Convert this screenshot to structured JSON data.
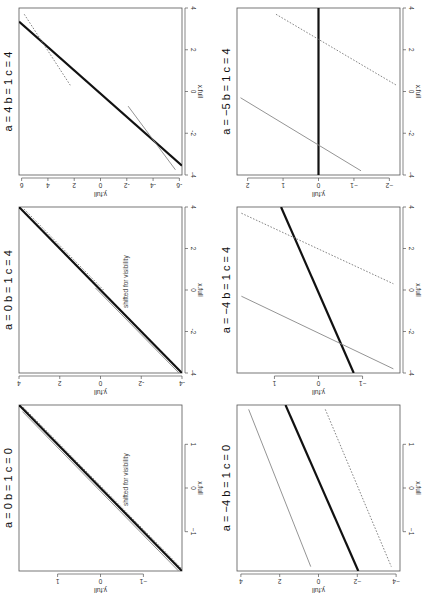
{
  "figure": {
    "orientation": "rotated 90 degrees clockwise",
    "panel_count": 6
  },
  "chart_data": [
    {
      "type": "line",
      "title": "a = 4  b = 1  c = 4",
      "title_parts": {
        "a": "4",
        "b": "1",
        "c": "4"
      },
      "xlabel": "x.full",
      "ylabel": "y.full",
      "xlim": [
        -4,
        4
      ],
      "ylim": [
        -6.2,
        6.2
      ],
      "xticks": [
        -4,
        -2,
        0,
        2,
        4
      ],
      "yticks": [
        -6,
        -4,
        -2,
        0,
        2,
        4,
        6
      ],
      "xtick_labels": [
        "-4",
        "-2",
        "0",
        "2",
        "4"
      ],
      "ytick_labels": [
        "-6",
        "-4",
        "-2",
        "0",
        "2",
        "4",
        "6"
      ],
      "note": "",
      "series": [
        {
          "name": "thick",
          "style": "solid-thick",
          "color": "#111111",
          "x": [
            -3.55,
            3.35
          ],
          "y": [
            -6.2,
            6.2
          ]
        },
        {
          "name": "thin",
          "style": "solid-thin",
          "color": "#888888",
          "x": [
            -0.7,
            -3.75
          ],
          "y": [
            -2.1,
            -5.7
          ]
        },
        {
          "name": "dotted",
          "style": "dotted",
          "color": "#777777",
          "x": [
            3.7,
            0.3
          ],
          "y": [
            5.8,
            2.3
          ]
        }
      ],
      "box": {
        "left": 19,
        "top": 8,
        "width": 163,
        "height": 167
      }
    },
    {
      "type": "line",
      "title": "a = 0  b = 1  c = 4",
      "title_parts": {
        "a": "0",
        "b": "1",
        "c": "4"
      },
      "xlabel": "x.full",
      "ylabel": "y.full",
      "xlim": [
        -4,
        4
      ],
      "ylim": [
        -4,
        4
      ],
      "xticks": [
        -4,
        -2,
        0,
        2,
        4
      ],
      "yticks": [
        -4,
        -2,
        0,
        2,
        4
      ],
      "xtick_labels": [
        "-4",
        "-2",
        "0",
        "2",
        "4"
      ],
      "ytick_labels": [
        "-4",
        "-2",
        "0",
        "2",
        "4"
      ],
      "note": "shifted for visibility",
      "series": [
        {
          "name": "thick",
          "style": "solid-thick",
          "color": "#111111",
          "x": [
            -4,
            4
          ],
          "y": [
            -4,
            4
          ]
        },
        {
          "name": "thin",
          "style": "solid-thin",
          "color": "#888888",
          "x": [
            -4,
            0.1
          ],
          "y": [
            -3.85,
            0.25
          ]
        },
        {
          "name": "dotted",
          "style": "dotted",
          "color": "#777777",
          "x": [
            3.9,
            0
          ],
          "y": [
            3.75,
            -0.15
          ]
        }
      ],
      "box": {
        "left": 19,
        "top": 207,
        "width": 163,
        "height": 166
      }
    },
    {
      "type": "line",
      "title": "a = 0  b = 1  c = 0",
      "title_parts": {
        "a": "0",
        "b": "1",
        "c": "0"
      },
      "xlabel": "x.full",
      "ylabel": "y.full",
      "xlim": [
        -1.9,
        1.9
      ],
      "ylim": [
        -1.9,
        1.9
      ],
      "xticks": [
        -1,
        0,
        1
      ],
      "yticks": [
        -1,
        0,
        1
      ],
      "xtick_labels": [
        "−1",
        "0",
        "1"
      ],
      "ytick_labels": [
        "−1",
        "0",
        "1"
      ],
      "note": "shifted for visibility",
      "series": [
        {
          "name": "thick",
          "style": "solid-thick",
          "color": "#111111",
          "x": [
            -1.9,
            1.9
          ],
          "y": [
            -1.9,
            1.9
          ]
        },
        {
          "name": "thin",
          "style": "solid-thin",
          "color": "#888888",
          "x": [
            -1.9,
            1.75
          ],
          "y": [
            -1.82,
            1.82
          ]
        },
        {
          "name": "dotted",
          "style": "dotted",
          "color": "#777777",
          "x": [
            1.85,
            -1.85
          ],
          "y": [
            1.8,
            -1.9
          ]
        }
      ],
      "box": {
        "left": 19,
        "top": 405,
        "width": 163,
        "height": 166
      }
    },
    {
      "type": "line",
      "title": "a = −5  b = 1  c = 4",
      "title_parts": {
        "a": "−5",
        "b": "1",
        "c": "4"
      },
      "xlabel": "x.full",
      "ylabel": "y.full",
      "xlim": [
        -4,
        4
      ],
      "ylim": [
        -2.3,
        2.3
      ],
      "xticks": [
        -4,
        -2,
        0,
        2,
        4
      ],
      "yticks": [
        -2,
        -1,
        0,
        1,
        2
      ],
      "xtick_labels": [
        "-4",
        "-2",
        "0",
        "2",
        "4"
      ],
      "ytick_labels": [
        "−2",
        "−1",
        "0",
        "1",
        "2"
      ],
      "note": "",
      "series": [
        {
          "name": "thick",
          "style": "solid-thick",
          "color": "#111111",
          "x": [
            -4,
            4
          ],
          "y": [
            0,
            0
          ]
        },
        {
          "name": "thin",
          "style": "solid-thin",
          "color": "#888888",
          "x": [
            -0.3,
            -3.8
          ],
          "y": [
            2.2,
            -1.2
          ]
        },
        {
          "name": "dotted",
          "style": "dotted",
          "color": "#777777",
          "x": [
            3.7,
            0.3
          ],
          "y": [
            1.2,
            -2.2
          ]
        }
      ],
      "box": {
        "left": 237,
        "top": 8,
        "width": 163,
        "height": 167
      }
    },
    {
      "type": "line",
      "title": "a = −4  b = 1  c = 4",
      "title_parts": {
        "a": "−4",
        "b": "1",
        "c": "4"
      },
      "xlabel": "x.full",
      "ylabel": "y.full",
      "xlim": [
        -4,
        4
      ],
      "ylim": [
        -1.85,
        1.85
      ],
      "xticks": [
        -4,
        -2,
        0,
        2,
        4
      ],
      "yticks": [
        -1,
        0,
        1
      ],
      "xtick_labels": [
        "-4",
        "-2",
        "0",
        "2",
        "4"
      ],
      "ytick_labels": [
        "−1",
        "0",
        "1"
      ],
      "note": "",
      "series": [
        {
          "name": "thick",
          "style": "solid-thick",
          "color": "#111111",
          "x": [
            4,
            -4
          ],
          "y": [
            0.85,
            -0.8
          ]
        },
        {
          "name": "thin",
          "style": "solid-thin",
          "color": "#888888",
          "x": [
            -0.3,
            -3.8
          ],
          "y": [
            1.75,
            -1.7
          ]
        },
        {
          "name": "dotted",
          "style": "dotted",
          "color": "#777777",
          "x": [
            3.7,
            0.3
          ],
          "y": [
            1.75,
            -1.7
          ]
        }
      ],
      "box": {
        "left": 237,
        "top": 207,
        "width": 163,
        "height": 166
      }
    },
    {
      "type": "line",
      "title": "a = −4  b = 1  c = 0",
      "title_parts": {
        "a": "−4",
        "b": "1",
        "c": "0"
      },
      "xlabel": "x.full",
      "ylabel": "y.full",
      "xlim": [
        -1.9,
        1.9
      ],
      "ylim": [
        -4.2,
        4.2
      ],
      "xticks": [
        -1,
        0,
        1
      ],
      "yticks": [
        -4,
        -2,
        0,
        2,
        4
      ],
      "xtick_labels": [
        "−1",
        "0",
        "1"
      ],
      "ytick_labels": [
        "−4",
        "−2",
        "0",
        "2",
        "4"
      ],
      "note": "",
      "series": [
        {
          "name": "thick",
          "style": "solid-thick",
          "color": "#111111",
          "x": [
            1.9,
            -1.9
          ],
          "y": [
            1.7,
            -2.05
          ]
        },
        {
          "name": "thin",
          "style": "solid-thin",
          "color": "#888888",
          "x": [
            1.8,
            -1.8
          ],
          "y": [
            3.6,
            0.4
          ]
        },
        {
          "name": "dotted",
          "style": "dotted",
          "color": "#777777",
          "x": [
            1.8,
            -1.8
          ],
          "y": [
            -0.35,
            -3.75
          ]
        }
      ],
      "box": {
        "left": 237,
        "top": 405,
        "width": 163,
        "height": 166
      }
    }
  ]
}
